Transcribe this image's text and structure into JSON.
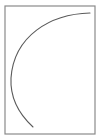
{
  "diagram": {
    "background": "#ffffff",
    "frame": {
      "x": 5,
      "y": 6,
      "width": 90,
      "height": 128,
      "stroke": "#8a8a8a",
      "stroke_width": 1.2
    },
    "curve": {
      "start": [
        90,
        13
      ],
      "control1": [
        40,
        14
      ],
      "control2": [
        4,
        50
      ],
      "mid": [
        11,
        78
      ],
      "end": [
        33,
        127
      ],
      "stroke": "#5a5a5a",
      "stroke_width": 1.1,
      "path": "M90 13 C 50 14, 14 36, 11 78 C 10 98, 20 115, 33 127"
    }
  }
}
